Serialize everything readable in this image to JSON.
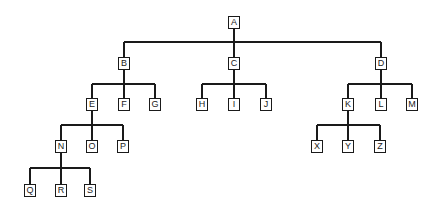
{
  "diagram": {
    "type": "tree",
    "line_color": "#1a1a1a",
    "nodes": [
      {
        "id": "A",
        "label": "A",
        "x": 234,
        "y": 22
      },
      {
        "id": "B",
        "label": "B",
        "x": 124,
        "y": 63
      },
      {
        "id": "C",
        "label": "C",
        "x": 234,
        "y": 63
      },
      {
        "id": "D",
        "label": "D",
        "x": 381,
        "y": 63
      },
      {
        "id": "E",
        "label": "E",
        "x": 92,
        "y": 104
      },
      {
        "id": "F",
        "label": "F",
        "x": 124,
        "y": 104
      },
      {
        "id": "G",
        "label": "G",
        "x": 155,
        "y": 104
      },
      {
        "id": "H",
        "label": "H",
        "x": 202,
        "y": 104
      },
      {
        "id": "I",
        "label": "I",
        "x": 234,
        "y": 104
      },
      {
        "id": "J",
        "label": "J",
        "x": 266,
        "y": 104
      },
      {
        "id": "K",
        "label": "K",
        "x": 348,
        "y": 104
      },
      {
        "id": "L",
        "label": "L",
        "x": 381,
        "y": 104
      },
      {
        "id": "M",
        "label": "M",
        "x": 412,
        "y": 104
      },
      {
        "id": "N",
        "label": "N",
        "x": 61,
        "y": 146
      },
      {
        "id": "O",
        "label": "O",
        "x": 92,
        "y": 146
      },
      {
        "id": "P",
        "label": "P",
        "x": 123,
        "y": 146
      },
      {
        "id": "X",
        "label": "X",
        "x": 317,
        "y": 146
      },
      {
        "id": "Y",
        "label": "Y",
        "x": 348,
        "y": 146
      },
      {
        "id": "Z",
        "label": "Z",
        "x": 380,
        "y": 146
      },
      {
        "id": "Q",
        "label": "Q",
        "x": 30,
        "y": 190
      },
      {
        "id": "R",
        "label": "R",
        "x": 61,
        "y": 190
      },
      {
        "id": "S",
        "label": "S",
        "x": 90,
        "y": 190
      }
    ],
    "edges": [
      {
        "parent": "A",
        "children": [
          "B",
          "C",
          "D"
        ],
        "bar_y": 42
      },
      {
        "parent": "B",
        "children": [
          "E",
          "F",
          "G"
        ],
        "bar_y": 84
      },
      {
        "parent": "C",
        "children": [
          "H",
          "I",
          "J"
        ],
        "bar_y": 84
      },
      {
        "parent": "D",
        "children": [
          "K",
          "L",
          "M"
        ],
        "bar_y": 84
      },
      {
        "parent": "E",
        "children": [
          "N",
          "O",
          "P"
        ],
        "bar_y": 125
      },
      {
        "parent": "K",
        "children": [
          "X",
          "Y",
          "Z"
        ],
        "bar_y": 125
      },
      {
        "parent": "N",
        "children": [
          "Q",
          "R",
          "S"
        ],
        "bar_y": 168
      }
    ]
  }
}
